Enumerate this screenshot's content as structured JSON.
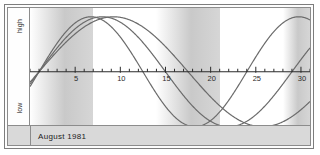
{
  "footer": {
    "period_label": "August 1981"
  },
  "y_axis": {
    "high_label": "high",
    "low_label": "low"
  },
  "chart_data": {
    "type": "line",
    "title": "August 1981",
    "xlabel": "",
    "ylabel": "",
    "xlim": [
      0,
      31
    ],
    "ylim": [
      -1,
      1
    ],
    "grid": false,
    "legend": "none",
    "zero_line": true,
    "x_tick_labels": [
      "5",
      "10",
      "15",
      "20",
      "25",
      "30"
    ],
    "x_tick_values": [
      5,
      10,
      15,
      20,
      25,
      30
    ],
    "minor_tick_interval": 1,
    "band_interval_days": 7,
    "band_color": "#c9c9c9",
    "curve_color": "#6b6b6b",
    "axis_color": "#2b2b2b",
    "series": [
      {
        "name": "physical",
        "period_days": 23,
        "phase_offset_days": 1.0,
        "amplitude": 1.0
      },
      {
        "name": "emotional",
        "period_days": 28,
        "phase_offset_days": 1.0,
        "amplitude": 1.0
      },
      {
        "name": "intellectual",
        "period_days": 33,
        "phase_offset_days": 1.0,
        "amplitude": 1.0
      }
    ]
  }
}
